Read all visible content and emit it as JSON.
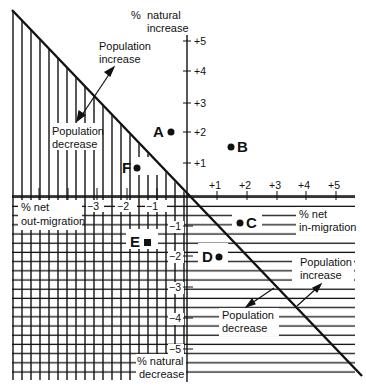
{
  "diagram": {
    "axes": {
      "y_top_label": [
        "%",
        "natural",
        "increase"
      ],
      "y_bottom_label": [
        "% natural",
        "decrease"
      ],
      "x_right_label": [
        "% net",
        "in-migration"
      ],
      "x_left_label": [
        "% net",
        "out-migration"
      ],
      "x_ticks_pos": [
        "+1",
        "+2",
        "+3",
        "+4",
        "+5"
      ],
      "x_ticks_neg": [
        "−1",
        "−2",
        "−3"
      ],
      "y_ticks_pos": [
        "+1",
        "+2",
        "+3",
        "+4",
        "+5"
      ],
      "y_ticks_neg": [
        "−1",
        "−2",
        "−3",
        "−4",
        "−5"
      ]
    },
    "annotations": {
      "upper_increase": [
        "Population",
        "increase"
      ],
      "upper_decrease": [
        "Population",
        "decrease"
      ],
      "lower_increase": [
        "Population",
        "increase"
      ],
      "lower_decrease": [
        "Population",
        "decrease"
      ]
    },
    "points": [
      {
        "label": "A",
        "x": -0.5,
        "y": 2.0
      },
      {
        "label": "B",
        "x": 1.5,
        "y": 1.5
      },
      {
        "label": "C",
        "x": 1.8,
        "y": -1.0
      },
      {
        "label": "D",
        "x": 1.1,
        "y": -2.0
      },
      {
        "label": "E",
        "x": -1.3,
        "y": -1.6
      },
      {
        "label": "F",
        "x": -1.7,
        "y": 0.9
      }
    ],
    "colors": {
      "ink": "#111111",
      "background": "#ffffff"
    }
  }
}
